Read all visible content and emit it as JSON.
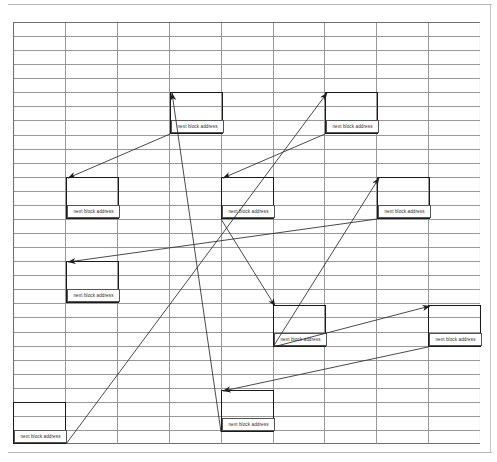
{
  "page": {
    "background_color": "#ffffff",
    "width": 497,
    "height": 462
  },
  "grid": {
    "name": "ruled-grid",
    "origin_x": 13,
    "origin_y": 22,
    "width": 467,
    "height": 422,
    "columns": 9,
    "rows": 30,
    "column_width": 51.9,
    "row_height": 14.07,
    "line_color": "#8d8d8d",
    "border_color": "#6f6f6f"
  },
  "frame": {
    "line_color": "#b9b9b9",
    "top_y": 4,
    "bottom_y": 452,
    "right_x": 490
  },
  "block_label": "next block address",
  "blocks": [
    {
      "id": "block-1",
      "x": 170,
      "y": 92,
      "w": 53,
      "h": 42,
      "label": "next block address"
    },
    {
      "id": "block-2",
      "x": 325,
      "y": 92,
      "w": 53,
      "h": 42,
      "label": "next block address"
    },
    {
      "id": "block-3",
      "x": 66,
      "y": 177,
      "w": 53,
      "h": 42,
      "label": "next block address"
    },
    {
      "id": "block-4",
      "x": 221,
      "y": 177,
      "w": 53,
      "h": 42,
      "label": "next block address"
    },
    {
      "id": "block-5",
      "x": 377,
      "y": 177,
      "w": 53,
      "h": 42,
      "label": "next block address"
    },
    {
      "id": "block-6",
      "x": 66,
      "y": 261,
      "w": 53,
      "h": 42,
      "label": "next block address"
    },
    {
      "id": "block-7",
      "x": 273,
      "y": 305,
      "w": 53,
      "h": 42,
      "label": "next block address"
    },
    {
      "id": "block-8",
      "x": 428,
      "y": 305,
      "w": 53,
      "h": 42,
      "label": "next block address"
    },
    {
      "id": "block-9",
      "x": 221,
      "y": 390,
      "w": 53,
      "h": 42,
      "label": "next block address"
    },
    {
      "id": "block-10",
      "x": 13,
      "y": 402,
      "w": 53,
      "h": 42,
      "label": "next block address"
    }
  ],
  "arrows": [
    {
      "id": "arrow-1",
      "from": "block-1",
      "to": "block-3",
      "x1": 170,
      "y1": 134,
      "x2": 68,
      "y2": 178
    },
    {
      "id": "arrow-2",
      "from": "block-2",
      "to": "block-4",
      "x1": 325,
      "y1": 134,
      "x2": 223,
      "y2": 178
    },
    {
      "id": "arrow-3",
      "from": "block-5",
      "to": "block-6",
      "x1": 377,
      "y1": 219,
      "x2": 68,
      "y2": 262
    },
    {
      "id": "arrow-4",
      "from": "block-7",
      "to": "block-5",
      "x1": 273,
      "y1": 347,
      "x2": 379,
      "y2": 178
    },
    {
      "id": "arrow-5",
      "from": "block-7",
      "to": "block-8",
      "x1": 273,
      "y1": 347,
      "x2": 430,
      "y2": 306
    },
    {
      "id": "arrow-6",
      "from": "block-8",
      "to": "block-9",
      "x1": 428,
      "y1": 347,
      "x2": 223,
      "y2": 391
    },
    {
      "id": "arrow-7",
      "from": "block-9",
      "to": "block-1",
      "x1": 221,
      "y1": 432,
      "x2": 172,
      "y2": 93
    },
    {
      "id": "arrow-8",
      "from": "block-10",
      "to": "block-2",
      "x1": 66,
      "y1": 444,
      "x2": 327,
      "y2": 93
    },
    {
      "id": "arrow-9",
      "from": "block-4",
      "to": "block-7",
      "x1": 221,
      "y1": 219,
      "x2": 275,
      "y2": 306
    }
  ],
  "colors": {
    "ink": "#1a1a1a",
    "grid_line": "#8d8d8d",
    "arrow": "#2a2a2a",
    "paper": "#ffffff"
  }
}
